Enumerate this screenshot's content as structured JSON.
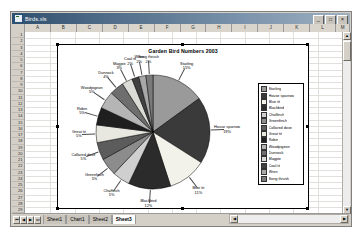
{
  "window": {
    "title": "Birds.xls",
    "icon": "excel-workbook-icon",
    "buttons": [
      {
        "name": "minimize",
        "glyph": "_"
      },
      {
        "name": "restore",
        "glyph": "□"
      },
      {
        "name": "close",
        "glyph": "×"
      }
    ]
  },
  "grid": {
    "columns": [
      "A",
      "B",
      "C",
      "D",
      "E",
      "F",
      "G",
      "H",
      "I",
      "J",
      "K",
      "L",
      "M"
    ],
    "rows": [
      "1",
      "2",
      "3",
      "4",
      "5",
      "6",
      "7",
      "8",
      "9",
      "10",
      "11",
      "12",
      "13",
      "14",
      "15",
      "16",
      "17",
      "18",
      "19",
      "20",
      "21",
      "22",
      "23",
      "24",
      "25",
      "26",
      "27",
      "28",
      "29"
    ]
  },
  "sheet_tabs": {
    "nav_first": "⏮",
    "nav_prev": "◀",
    "nav_next": "▶",
    "nav_last": "⏭",
    "items": [
      {
        "label": "Sheet1",
        "active": false
      },
      {
        "label": "Chart1",
        "active": false
      },
      {
        "label": "Sheet2",
        "active": false
      },
      {
        "label": "Sheet3",
        "active": true
      }
    ]
  },
  "scrollbars": {
    "up_arrow": "▲",
    "down_arrow": "▼",
    "left_arrow": "◀",
    "right_arrow": "▶"
  },
  "chart_data": {
    "type": "pie",
    "title": "Garden Bird Numbers 2003",
    "xlabel": "",
    "ylabel": "",
    "legend_position": "right",
    "grid": false,
    "categories": [
      "Starling",
      "House sparrow",
      "Blue tit",
      "Blackbird",
      "Chaffinch",
      "Greenfinch",
      "Collared dove",
      "Great tit",
      "Robin",
      "Woodpigeon",
      "Dunnock",
      "Magpie",
      "Coal tit",
      "Wren",
      "Song thrush"
    ],
    "values": [
      15,
      19,
      11,
      12,
      5,
      5,
      5,
      5,
      5,
      5,
      4,
      3,
      2,
      2,
      2
    ],
    "value_labels": [
      "15%",
      "19%",
      "11%",
      "12%",
      "5%",
      "5%",
      "5%",
      "5%",
      "5%",
      "5%",
      "4%",
      "3%",
      "2%",
      "2%",
      "2%"
    ],
    "colors": [
      "#9a9a9a",
      "#3a3a3a",
      "#f2f2ea",
      "#2b2b2b",
      "#cfcfcf",
      "#8c8c8c",
      "#5c5c5c",
      "#e8e8e0",
      "#1f1f1f",
      "#b5b5b5",
      "#6e6e6e",
      "#dcdcd6",
      "#404040",
      "#a8a8a8",
      "#7a7a7a"
    ]
  }
}
